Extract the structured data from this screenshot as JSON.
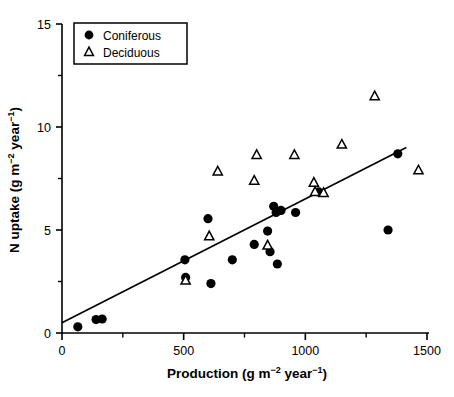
{
  "chart_data": {
    "type": "scatter",
    "title": "",
    "xlabel": "Production (g m⁻² year⁻¹)",
    "ylabel": "N uptake (g m⁻² year⁻¹)",
    "xlim": [
      0,
      1540
    ],
    "ylim": [
      0,
      15
    ],
    "xticks": [
      0,
      500,
      1000,
      1500
    ],
    "xtick_labels": [
      "0",
      "500",
      "1000",
      "1500"
    ],
    "xminor_ticks": [
      250,
      750,
      1250
    ],
    "yticks": [
      0,
      5,
      10,
      15
    ],
    "ytick_labels": [
      "0",
      "5",
      "10",
      "15"
    ],
    "yminor_ticks": [
      2.5,
      7.5,
      12.5
    ],
    "grid": false,
    "legend_position": "top-left",
    "series": [
      {
        "name": "Coniferous",
        "marker": "filled-circle",
        "color": "#000000",
        "points": [
          [
            65,
            0.3
          ],
          [
            140,
            0.65
          ],
          [
            165,
            0.68
          ],
          [
            505,
            3.55
          ],
          [
            508,
            2.7
          ],
          [
            600,
            5.55
          ],
          [
            612,
            2.4
          ],
          [
            700,
            3.55
          ],
          [
            790,
            4.3
          ],
          [
            845,
            4.95
          ],
          [
            855,
            3.95
          ],
          [
            870,
            6.15
          ],
          [
            880,
            5.85
          ],
          [
            885,
            3.35
          ],
          [
            900,
            5.95
          ],
          [
            960,
            5.85
          ],
          [
            1055,
            6.85
          ],
          [
            1340,
            5.0
          ],
          [
            1380,
            8.7
          ]
        ]
      },
      {
        "name": "Deciduous",
        "marker": "open-triangle",
        "color": "#000000",
        "points": [
          [
            508,
            2.55
          ],
          [
            605,
            4.7
          ],
          [
            640,
            7.85
          ],
          [
            790,
            7.4
          ],
          [
            800,
            8.65
          ],
          [
            845,
            4.25
          ],
          [
            955,
            8.65
          ],
          [
            1035,
            7.3
          ],
          [
            1040,
            6.85
          ],
          [
            1075,
            6.8
          ],
          [
            1150,
            9.15
          ],
          [
            1285,
            11.5
          ],
          [
            1465,
            7.9
          ]
        ]
      }
    ],
    "fit_line": {
      "name": "regression-line",
      "x_start": 0,
      "y_start": 0.5,
      "x_end": 1415,
      "y_end": 9.0
    },
    "legend": [
      {
        "label": "Coniferous",
        "marker": "filled-circle"
      },
      {
        "label": "Deciduous",
        "marker": "open-triangle"
      }
    ]
  },
  "axes": {
    "x_title": "Production (g m",
    "x_title_sup1": "−2",
    "x_title_mid": " year",
    "x_title_sup2": "−1",
    "x_title_end": ")",
    "y_title": "N uptake (g m",
    "y_title_sup1": "−2",
    "y_title_mid": " year",
    "y_title_sup2": "−1",
    "y_title_end": ")"
  }
}
